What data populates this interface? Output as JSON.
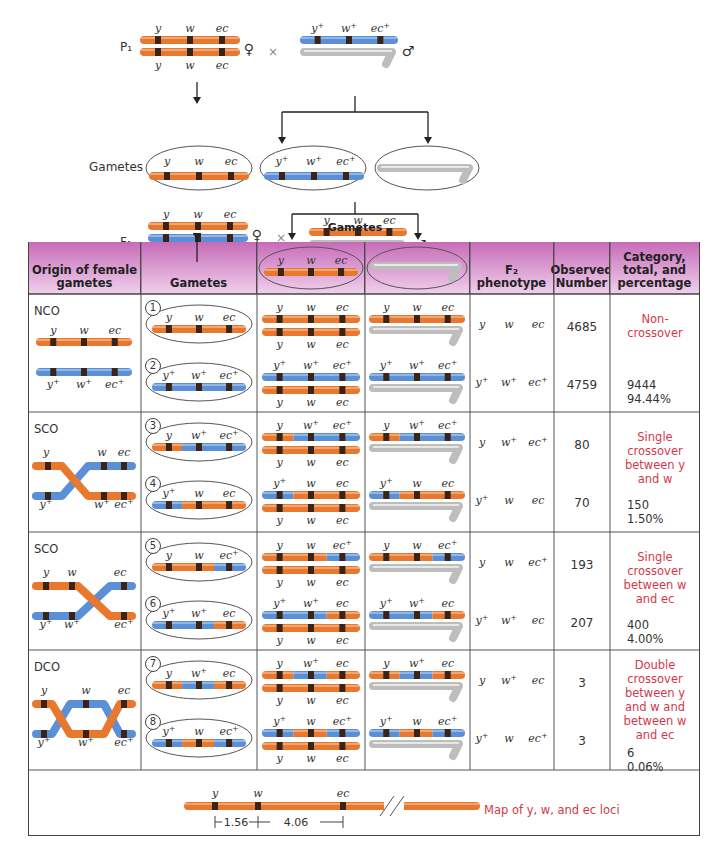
{
  "colors": {
    "orange": "#e8782e",
    "blue": "#5b8fd6",
    "gray": "#c8c8c8",
    "band": "#3a2418",
    "header_top": "#c76bb8",
    "header_bottom": "#f0d0ec",
    "category_text": "#d3384a"
  },
  "top": {
    "p1_label": "P₁",
    "f1_label": "F₁",
    "gametes_label": "Gametes",
    "gametes_bracket_label": "Gametes",
    "female_symbol": "♀",
    "male_symbol": "♂",
    "cross_symbol": "×",
    "loci_mutant": [
      "y",
      "w",
      "ec"
    ],
    "loci_wild": [
      "y⁺",
      "w⁺",
      "ec⁺"
    ]
  },
  "table": {
    "headers": {
      "origin": "Origin of female gametes",
      "gametes": "Gametes",
      "f2_phenotype_line1": "F₂",
      "f2_phenotype_line2": "phenotype",
      "observed": "Observed Number",
      "category": "Category, total, and percentage"
    },
    "groups": [
      {
        "type": "NCO",
        "category_text": "Non-crossover",
        "total": "9444",
        "percent": "94.44%",
        "rows": [
          {
            "index": "1",
            "gamete": [
              "y",
              "w",
              "ec"
            ],
            "phenotype": [
              "y",
              "w",
              "ec"
            ],
            "observed": "4685"
          },
          {
            "index": "2",
            "gamete": [
              "y⁺",
              "w⁺",
              "ec⁺"
            ],
            "phenotype": [
              "y⁺",
              "w⁺",
              "ec⁺"
            ],
            "observed": "4759"
          }
        ]
      },
      {
        "type": "SCO",
        "category_text": "Single crossover between y and w",
        "total": "150",
        "percent": "1.50%",
        "rows": [
          {
            "index": "3",
            "gamete": [
              "y",
              "w⁺",
              "ec⁺"
            ],
            "phenotype": [
              "y",
              "w⁺",
              "ec⁺"
            ],
            "observed": "80"
          },
          {
            "index": "4",
            "gamete": [
              "y⁺",
              "w",
              "ec"
            ],
            "phenotype": [
              "y⁺",
              "w",
              "ec"
            ],
            "observed": "70"
          }
        ]
      },
      {
        "type": "SCO",
        "category_text": "Single crossover between w and ec",
        "total": "400",
        "percent": "4.00%",
        "rows": [
          {
            "index": "5",
            "gamete": [
              "y",
              "w",
              "ec⁺"
            ],
            "phenotype": [
              "y",
              "w",
              "ec⁺"
            ],
            "observed": "193"
          },
          {
            "index": "6",
            "gamete": [
              "y⁺",
              "w⁺",
              "ec"
            ],
            "phenotype": [
              "y⁺",
              "w⁺",
              "ec"
            ],
            "observed": "207"
          }
        ]
      },
      {
        "type": "DCO",
        "category_text": "Double crossover between y and w and between w and ec",
        "total": "6",
        "percent": "0.06%",
        "rows": [
          {
            "index": "7",
            "gamete": [
              "y",
              "w⁺",
              "ec"
            ],
            "phenotype": [
              "y",
              "w⁺",
              "ec"
            ],
            "observed": "3"
          },
          {
            "index": "8",
            "gamete": [
              "y⁺",
              "w",
              "ec⁺"
            ],
            "phenotype": [
              "y⁺",
              "w",
              "ec⁺"
            ],
            "observed": "3"
          }
        ]
      }
    ]
  },
  "map": {
    "caption": "Map of y, w, and ec loci",
    "loci": [
      "y",
      "w",
      "ec"
    ],
    "distance_y_w": "1.56",
    "distance_w_ec": "4.06"
  }
}
